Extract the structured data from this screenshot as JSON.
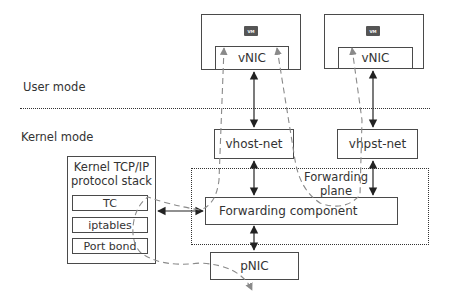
{
  "modes": {
    "user_mode": "User mode",
    "kernel_mode": "Kernel mode"
  },
  "vms": [
    {
      "chip_label": "VM",
      "vnic_label": "vNIC"
    },
    {
      "chip_label": "VM",
      "vnic_label": "vNIC"
    }
  ],
  "vhost": [
    {
      "label": "vhost-net"
    },
    {
      "label": "vhpst-net"
    }
  ],
  "forwarding_plane": {
    "label_line1": "Forwarding",
    "label_line2": "plane",
    "component_label": "Forwarding component"
  },
  "kernel_stack": {
    "title_line1": "Kernel TCP/IP",
    "title_line2": "protocol stack",
    "items": [
      "TC",
      "iptables",
      "Port bond"
    ]
  },
  "pnic": {
    "label": "pNIC"
  },
  "colors": {
    "solid_arrow": "#222222",
    "dashed_path": "#8a8a8a",
    "box_border": "#4a4a4a"
  }
}
